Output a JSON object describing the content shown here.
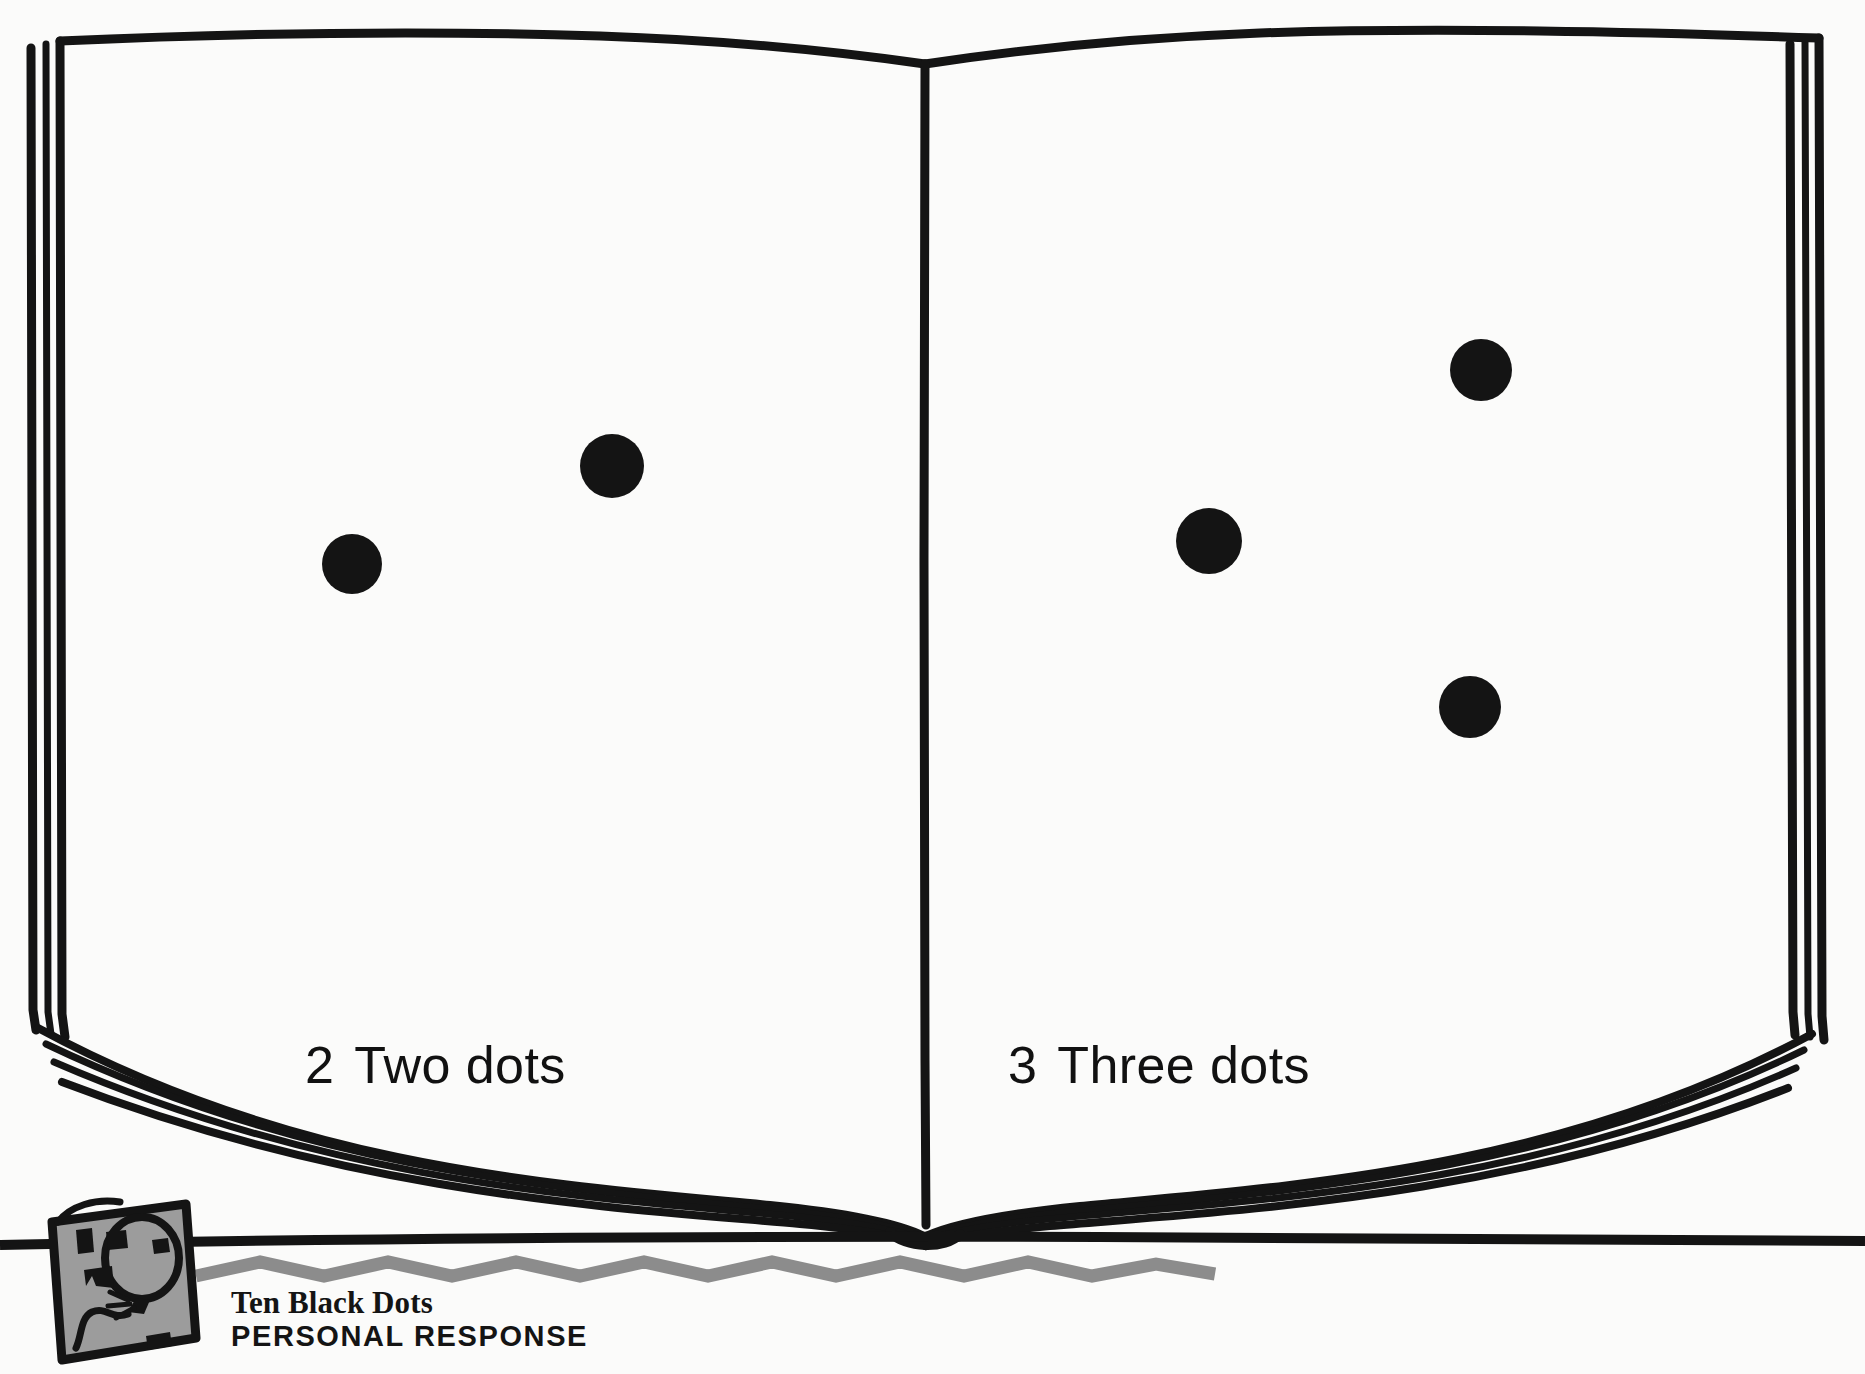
{
  "page": {
    "background_color": "#fbfbfa",
    "ink_color": "#111111",
    "accent_gray": "#8c8c8c"
  },
  "illustration": {
    "name": "open-book-illustration",
    "description": "Line drawing of an open book with two blank facing pages"
  },
  "spreads": [
    {
      "side": "left",
      "number": "2",
      "caption": "Two dots",
      "dot_count": 2,
      "dots": [
        {
          "cx": 352,
          "cy": 564,
          "r": 30,
          "color": "#141414"
        },
        {
          "cx": 612,
          "cy": 466,
          "r": 32,
          "color": "#141414"
        }
      ]
    },
    {
      "side": "right",
      "number": "3",
      "caption": "Three dots",
      "dot_count": 3,
      "dots": [
        {
          "cx": 1481,
          "cy": 370,
          "r": 31,
          "color": "#141414"
        },
        {
          "cx": 1209,
          "cy": 541,
          "r": 33,
          "color": "#141414"
        },
        {
          "cx": 1470,
          "cy": 707,
          "r": 31,
          "color": "#141414"
        }
      ]
    }
  ],
  "footer": {
    "icon_name": "balloon-icon",
    "icon_fill": "#9c9c9c",
    "title": "Ten Black Dots",
    "subtitle": "PERSONAL RESPONSE",
    "rule_color": "#8c8c8c"
  }
}
